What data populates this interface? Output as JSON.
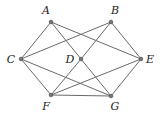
{
  "diagram": {
    "type": "graph",
    "nodes": [
      {
        "id": "A",
        "label": "A",
        "x": 51,
        "y": 22,
        "lx": 46,
        "ly": 14
      },
      {
        "id": "B",
        "label": "B",
        "x": 111,
        "y": 22,
        "lx": 115,
        "ly": 14
      },
      {
        "id": "C",
        "label": "C",
        "x": 21,
        "y": 59,
        "lx": 11,
        "ly": 63
      },
      {
        "id": "D",
        "label": "D",
        "x": 81,
        "y": 59,
        "lx": 70,
        "ly": 63
      },
      {
        "id": "E",
        "label": "E",
        "x": 141,
        "y": 59,
        "lx": 150,
        "ly": 63
      },
      {
        "id": "F",
        "label": "F",
        "x": 51,
        "y": 95,
        "lx": 46,
        "ly": 110
      },
      {
        "id": "G",
        "label": "G",
        "x": 111,
        "y": 96,
        "lx": 115,
        "ly": 110
      }
    ],
    "edges": [
      [
        "A",
        "C"
      ],
      [
        "A",
        "D"
      ],
      [
        "A",
        "E"
      ],
      [
        "B",
        "C"
      ],
      [
        "B",
        "D"
      ],
      [
        "B",
        "E"
      ],
      [
        "C",
        "F"
      ],
      [
        "C",
        "G"
      ],
      [
        "D",
        "F"
      ],
      [
        "D",
        "G"
      ],
      [
        "E",
        "F"
      ],
      [
        "E",
        "G"
      ],
      [
        "F",
        "G"
      ]
    ],
    "colors": {
      "edge": "#6a6a6a",
      "node": "#777777",
      "label": "#222222"
    }
  }
}
